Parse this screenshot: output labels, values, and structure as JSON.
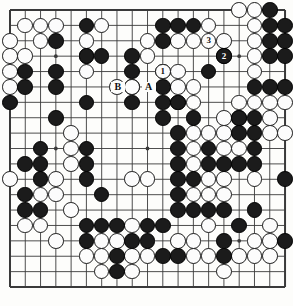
{
  "figure": {
    "type": "go-board-diagram",
    "caption": "",
    "board_size": 19,
    "colors": {
      "board_background": "#fdfdfb",
      "grid_line": "#3a3a3a",
      "black_stone": "#1b1b1b",
      "white_stone": "#fcfcfc",
      "black_stone_border": "#000000",
      "white_stone_border": "#1b1b1b"
    }
  },
  "board": {
    "geometry": {
      "origin_x": 10,
      "origin_y": 10,
      "spacing_x": 15.28,
      "spacing_y": 15.39,
      "stone_diameter": 15.6,
      "border_thickness": 2
    },
    "star_points": [
      [
        3,
        3
      ],
      [
        9,
        3
      ],
      [
        15,
        3
      ],
      [
        3,
        9
      ],
      [
        9,
        9
      ],
      [
        15,
        9
      ],
      [
        3,
        15
      ],
      [
        9,
        15
      ],
      [
        15,
        15
      ]
    ],
    "black_stones": [
      [
        10,
        1
      ],
      [
        11,
        1
      ],
      [
        12,
        1
      ],
      [
        17,
        1
      ],
      [
        18,
        1
      ],
      [
        10,
        2
      ],
      [
        17,
        2
      ],
      [
        18,
        2
      ],
      [
        5,
        1
      ],
      [
        17,
        0
      ],
      [
        3,
        2
      ],
      [
        8,
        3
      ],
      [
        5,
        3
      ],
      [
        6,
        3
      ],
      [
        17,
        3
      ],
      [
        18,
        3
      ],
      [
        1,
        4
      ],
      [
        3,
        4
      ],
      [
        8,
        4
      ],
      [
        13,
        4
      ],
      [
        14,
        3
      ],
      [
        1,
        5
      ],
      [
        3,
        5
      ],
      [
        8,
        5
      ],
      [
        10,
        5
      ],
      [
        16,
        5
      ],
      [
        17,
        5
      ],
      [
        18,
        5
      ],
      [
        0,
        6
      ],
      [
        5,
        6
      ],
      [
        8,
        6
      ],
      [
        10,
        6
      ],
      [
        11,
        6
      ],
      [
        3,
        7
      ],
      [
        10,
        7
      ],
      [
        12,
        7
      ],
      [
        15,
        7
      ],
      [
        16,
        7
      ],
      [
        11,
        8
      ],
      [
        15,
        8
      ],
      [
        16,
        8
      ],
      [
        2,
        9
      ],
      [
        5,
        9
      ],
      [
        11,
        9
      ],
      [
        13,
        9
      ],
      [
        16,
        9
      ],
      [
        1,
        10
      ],
      [
        2,
        10
      ],
      [
        5,
        10
      ],
      [
        11,
        10
      ],
      [
        13,
        10
      ],
      [
        14,
        10
      ],
      [
        15,
        10
      ],
      [
        16,
        10
      ],
      [
        2,
        11
      ],
      [
        5,
        11
      ],
      [
        11,
        11
      ],
      [
        12,
        11
      ],
      [
        18,
        11
      ],
      [
        1,
        12
      ],
      [
        6,
        12
      ],
      [
        11,
        12
      ],
      [
        1,
        13
      ],
      [
        2,
        13
      ],
      [
        11,
        13
      ],
      [
        12,
        13
      ],
      [
        13,
        13
      ],
      [
        14,
        13
      ],
      [
        16,
        13
      ],
      [
        5,
        14
      ],
      [
        6,
        14
      ],
      [
        7,
        14
      ],
      [
        9,
        14
      ],
      [
        10,
        14
      ],
      [
        15,
        14
      ],
      [
        5,
        15
      ],
      [
        8,
        15
      ],
      [
        9,
        15
      ],
      [
        14,
        15
      ],
      [
        18,
        15
      ],
      [
        7,
        16
      ],
      [
        10,
        16
      ],
      [
        11,
        16
      ],
      [
        14,
        16
      ],
      [
        7,
        17
      ]
    ],
    "white_stones": [
      [
        15,
        0
      ],
      [
        16,
        0
      ],
      [
        1,
        1
      ],
      [
        2,
        1
      ],
      [
        3,
        1
      ],
      [
        6,
        1
      ],
      [
        13,
        1
      ],
      [
        16,
        1
      ],
      [
        0,
        2
      ],
      [
        2,
        2
      ],
      [
        5,
        2
      ],
      [
        9,
        2
      ],
      [
        11,
        2
      ],
      [
        12,
        2
      ],
      [
        14,
        2
      ],
      [
        16,
        2
      ],
      [
        0,
        3
      ],
      [
        1,
        3
      ],
      [
        5,
        3
      ],
      [
        9,
        3
      ],
      [
        16,
        3
      ],
      [
        0,
        4
      ],
      [
        5,
        4
      ],
      [
        10,
        4
      ],
      [
        11,
        4
      ],
      [
        16,
        4
      ],
      [
        0,
        5
      ],
      [
        7,
        5
      ],
      [
        11,
        5
      ],
      [
        12,
        5
      ],
      [
        11,
        6
      ],
      [
        12,
        6
      ],
      [
        15,
        6
      ],
      [
        16,
        6
      ],
      [
        17,
        6
      ],
      [
        18,
        6
      ],
      [
        14,
        7
      ],
      [
        15,
        7
      ],
      [
        17,
        7
      ],
      [
        4,
        8
      ],
      [
        12,
        8
      ],
      [
        13,
        8
      ],
      [
        14,
        8
      ],
      [
        17,
        8
      ],
      [
        18,
        8
      ],
      [
        4,
        9
      ],
      [
        12,
        9
      ],
      [
        14,
        9
      ],
      [
        15,
        9
      ],
      [
        4,
        10
      ],
      [
        12,
        10
      ],
      [
        0,
        11
      ],
      [
        3,
        11
      ],
      [
        8,
        11
      ],
      [
        9,
        11
      ],
      [
        13,
        11
      ],
      [
        14,
        11
      ],
      [
        16,
        11
      ],
      [
        2,
        12
      ],
      [
        3,
        12
      ],
      [
        12,
        12
      ],
      [
        13,
        12
      ],
      [
        14,
        12
      ],
      [
        4,
        13
      ],
      [
        1,
        14
      ],
      [
        2,
        14
      ],
      [
        8,
        14
      ],
      [
        13,
        14
      ],
      [
        17,
        14
      ],
      [
        3,
        15
      ],
      [
        6,
        15
      ],
      [
        7,
        15
      ],
      [
        11,
        15
      ],
      [
        12,
        15
      ],
      [
        16,
        15
      ],
      [
        17,
        15
      ],
      [
        5,
        16
      ],
      [
        6,
        16
      ],
      [
        8,
        16
      ],
      [
        9,
        16
      ],
      [
        12,
        16
      ],
      [
        13,
        16
      ],
      [
        15,
        16
      ],
      [
        16,
        16
      ],
      [
        17,
        16
      ],
      [
        6,
        17
      ],
      [
        8,
        17
      ],
      [
        14,
        17
      ]
    ],
    "numbered_stones": [
      {
        "label": "1",
        "color": "white",
        "col": 10,
        "row": 4
      },
      {
        "label": "2",
        "color": "black",
        "col": 14,
        "row": 3
      },
      {
        "label": "3",
        "color": "white",
        "col": 13,
        "row": 2
      }
    ],
    "point_labels": [
      {
        "label": "A",
        "col": 9,
        "row": 5
      },
      {
        "label": "B",
        "col": 7,
        "row": 5
      }
    ],
    "labeled_white_stone": {
      "col": 8,
      "row": 5
    }
  }
}
